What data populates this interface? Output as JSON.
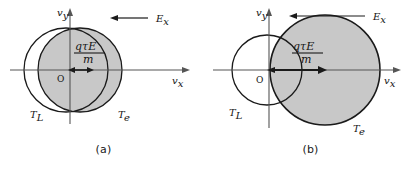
{
  "figure": {
    "background": "#ffffff",
    "shade_color": "#c8c8c8",
    "stroke_color": "#1a1a1a",
    "axis_color": "#555555"
  },
  "labels": {
    "axis_y": "v",
    "axis_y_sub": "y",
    "axis_x": "v",
    "axis_x_sub": "x",
    "field": "E",
    "field_sub": "x",
    "origin": "O",
    "drift_numer_q": "q",
    "drift_numer_tau": "τ",
    "drift_numer_E": "E",
    "drift_denom": "m",
    "circle_cold": "T",
    "circle_cold_sub": "L",
    "circle_hot": "T",
    "circle_hot_sub": "e"
  },
  "panels": [
    {
      "id": "a",
      "caption": "(a)",
      "origin_x": 70,
      "origin_y": 70,
      "cold_circle": {
        "cx": 66,
        "cy": 70,
        "r": 42
      },
      "hot_circle": {
        "cx": 80,
        "cy": 70,
        "r": 42
      },
      "drift_arrow": {
        "x1": 70,
        "x2": 92,
        "y": 70
      },
      "field_arrow": {
        "x1": 148,
        "x2": 112,
        "y": 18
      },
      "cold_label": {
        "x": 30,
        "y": 114
      },
      "hot_label": {
        "x": 118,
        "y": 114
      }
    },
    {
      "id": "b",
      "caption": "(b)",
      "origin_x": 62,
      "origin_y": 70,
      "cold_circle": {
        "cx": 60,
        "cy": 70,
        "r": 35
      },
      "hot_circle": {
        "cx": 118,
        "cy": 70,
        "r": 55
      },
      "drift_arrow": {
        "x1": 62,
        "x2": 118,
        "y": 70
      },
      "field_arrow": {
        "x1": 158,
        "x2": 82,
        "y": 16
      },
      "cold_label": {
        "x": 22,
        "y": 112
      },
      "hot_label": {
        "x": 146,
        "y": 128
      }
    }
  ]
}
